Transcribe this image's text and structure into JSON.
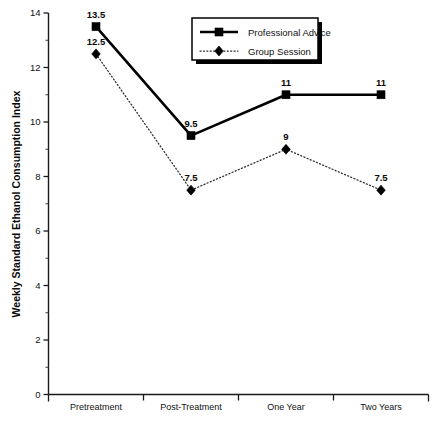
{
  "chart_data": {
    "type": "line",
    "title": "",
    "xlabel": "",
    "ylabel": "Weekly Standard Ethanol Consumption Index",
    "categories": [
      "Pretreatment",
      "Post-Treatment",
      "One Year",
      "Two Years"
    ],
    "ylim": [
      0,
      14
    ],
    "ytick_labels": [
      "0",
      "2",
      "4",
      "6",
      "8",
      "10",
      "12",
      "14"
    ],
    "ytick_values": [
      0,
      2,
      4,
      6,
      8,
      10,
      12,
      14
    ],
    "minor_tick_step": 1,
    "grid": false,
    "legend_position": "top-center",
    "series": [
      {
        "name": "Professional Advice",
        "marker": "square",
        "line_style": "solid",
        "color": "#000000",
        "values": [
          13.5,
          9.5,
          11,
          11
        ],
        "data_labels": [
          "13.5",
          "9.5",
          "11",
          "11"
        ]
      },
      {
        "name": "Group Session",
        "marker": "diamond",
        "line_style": "dotted",
        "color": "#2a2a2a",
        "values": [
          12.5,
          7.5,
          9,
          7.5
        ],
        "data_labels": [
          "12.5",
          "7.5",
          "9",
          "7.5"
        ]
      }
    ]
  }
}
